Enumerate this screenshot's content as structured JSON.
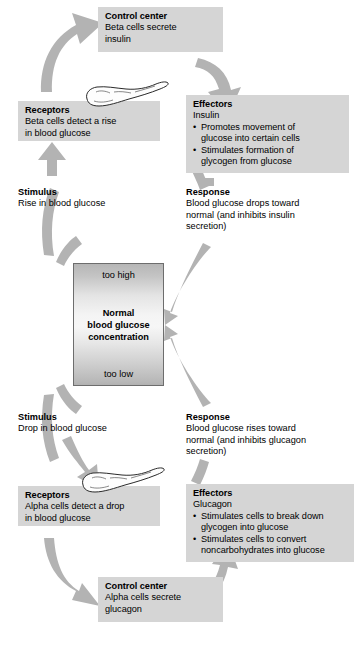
{
  "diagram": {
    "colors": {
      "box_fill": "#d5d5d5",
      "arrow_fill": "#b0b0b0",
      "center_border": "#6d6d6d",
      "text": "#000000"
    }
  },
  "center": {
    "too_high": "too high",
    "too_low": "too low",
    "line1": "Normal",
    "line2": "blood glucose",
    "line3": "concentration"
  },
  "upper_loop": {
    "control_center": {
      "heading": "Control center",
      "line1": "Beta cells secrete",
      "line2": "insulin"
    },
    "receptors": {
      "heading": "Receptors",
      "line1": "Beta cells detect a rise",
      "line2": "in blood glucose"
    },
    "effectors": {
      "heading": "Effectors",
      "line1": "Insulin",
      "bullets": [
        "Promotes movement of glucose into certain cells",
        "Stimulates formation of glycogen from glucose"
      ],
      "bullet_lines": [
        [
          "Promotes movement of",
          "glucose into certain cells"
        ],
        [
          "Stimulates formation of",
          "glycogen from glucose"
        ]
      ]
    },
    "stimulus": {
      "heading": "Stimulus",
      "line1": "Rise in blood glucose"
    },
    "response": {
      "heading": "Response",
      "line1": "Blood glucose drops toward",
      "line2": "normal (and inhibits insulin",
      "line3": "secretion)"
    }
  },
  "lower_loop": {
    "stimulus": {
      "heading": "Stimulus",
      "line1": "Drop in blood glucose"
    },
    "response": {
      "heading": "Response",
      "line1": "Blood glucose rises toward",
      "line2": "normal (and inhibits glucagon",
      "line3": "secretion)"
    },
    "receptors": {
      "heading": "Receptors",
      "line1": "Alpha cells detect a drop",
      "line2": "in blood glucose"
    },
    "effectors": {
      "heading": "Effectors",
      "line1": "Glucagon",
      "bullets": [
        "Stimulates cells to break down glycogen into glucose",
        "Stimulates cells to convert noncarbohydrates into glucose"
      ],
      "bullet_lines": [
        [
          "Stimulates cells to break down",
          "glycogen into glucose"
        ],
        [
          "Stimulates cells to convert",
          "noncarbohydrates into glucose"
        ]
      ]
    },
    "control_center": {
      "heading": "Control center",
      "line1": "Alpha cells secrete",
      "line2": "glucagon"
    }
  },
  "illustrations": {
    "pancreas_top": "pancreas-icon",
    "pancreas_bottom": "pancreas-icon"
  }
}
